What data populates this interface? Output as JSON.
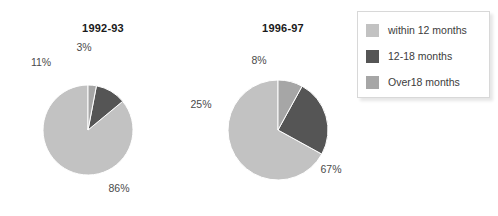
{
  "colors": {
    "within_12_months": "#c2c2c2",
    "months_12_18": "#555555",
    "over_18_months": "#a6a6a6",
    "background": "#ffffff",
    "label_text": "#4a4a4a",
    "title_text": "#1a1a1a",
    "legend_border": "#d8d8d8"
  },
  "legend": {
    "items": [
      {
        "label": "within 12 months",
        "color": "#c2c2c2",
        "swatch": "legend-swatch-within-12-months"
      },
      {
        "label": "12-18 months",
        "color": "#555555",
        "swatch": "legend-swatch-12-18-months"
      },
      {
        "label": "Over18 months",
        "color": "#a6a6a6",
        "swatch": "legend-swatch-over-18-months"
      }
    ]
  },
  "charts": [
    {
      "title": "1992-93",
      "labels": {
        "within": "86%",
        "mid": "11%",
        "over": "3%"
      }
    },
    {
      "title": "1996-97",
      "labels": {
        "within": "67%",
        "mid": "25%",
        "over": "8%"
      }
    }
  ],
  "chart_data": [
    {
      "type": "pie",
      "title": "1992-93",
      "categories": [
        "within 12 months",
        "12-18 months",
        "Over18 months"
      ],
      "values": [
        86,
        11,
        3
      ],
      "value_labels": [
        "86%",
        "11%",
        "3%"
      ],
      "colors": [
        "#c2c2c2",
        "#555555",
        "#a6a6a6"
      ],
      "units": "percent",
      "legend_position": "right",
      "start_angle_deg": 0,
      "direction": "counterclockwise"
    },
    {
      "type": "pie",
      "title": "1996-97",
      "categories": [
        "within 12 months",
        "12-18 months",
        "Over18 months"
      ],
      "values": [
        67,
        25,
        8
      ],
      "value_labels": [
        "67%",
        "25%",
        "8%"
      ],
      "colors": [
        "#c2c2c2",
        "#555555",
        "#a6a6a6"
      ],
      "units": "percent",
      "legend_position": "right",
      "start_angle_deg": 0,
      "direction": "counterclockwise"
    }
  ]
}
